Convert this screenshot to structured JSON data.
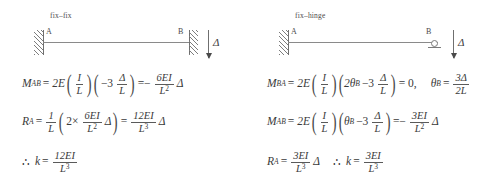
{
  "figure": {
    "line_color": "#8a8a8a",
    "text_color": "#3a3a3a",
    "background": "#ffffff"
  },
  "panels": [
    {
      "id": "fix-fix",
      "title": "fix–fix",
      "node_left": "A",
      "node_right": "B",
      "support_left": "fixed",
      "support_right": "fixed",
      "delta_label": "Δ",
      "equations": [
        {
          "id": "moment-ab",
          "parts": {
            "lhs_base": "M",
            "lhs_sub": "AB",
            "eq1": "=",
            "coef": "2E",
            "f1_num": "I",
            "f1_den": "L",
            "inner_coef": "−3",
            "f2_num": "Δ",
            "f2_den": "L",
            "eq2": "=−",
            "f3_num": "6EI",
            "f3_den": "L",
            "f3_den_sup": "2",
            "tail": "Δ"
          }
        },
        {
          "id": "reaction-a",
          "parts": {
            "lhs_base": "R",
            "lhs_sub": "A",
            "eq1": "=",
            "f1_num": "1",
            "f1_den": "L",
            "inner_coef": "2×",
            "f2_num": "6EI",
            "f2_den": "L",
            "f2_den_sup": "2",
            "inner_tail": "Δ",
            "eq2": "=",
            "f3_num": "12EI",
            "f3_den": "L",
            "f3_den_sup": "3",
            "tail": "Δ"
          }
        },
        {
          "id": "stiffness",
          "parts": {
            "therefore": "∴",
            "lhs_base": "k",
            "eq1": "=",
            "f1_num": "12EI",
            "f1_den": "L",
            "f1_den_sup": "3"
          }
        }
      ]
    },
    {
      "id": "fix-hinge",
      "title": "fix–hinge",
      "node_left": "A",
      "node_right": "B",
      "support_left": "fixed",
      "support_right": "hinge",
      "delta_label": "Δ",
      "equations": [
        {
          "id": "moment-ba",
          "parts": {
            "lhs_base": "M",
            "lhs_sub": "BA",
            "eq1": "=",
            "coef": "2E",
            "f1_num": "I",
            "f1_den": "L",
            "inner_lead": "2θ",
            "inner_lead_sub": "B",
            "inner_coef": "−3",
            "f2_num": "Δ",
            "f2_den": "L",
            "eq2": "= 0,",
            "theta_base": "θ",
            "theta_sub": "B",
            "eq3": "=",
            "f3_num": "3Δ",
            "f3_den": "2L"
          }
        },
        {
          "id": "moment-ab",
          "parts": {
            "lhs_base": "M",
            "lhs_sub": "AB",
            "eq1": "=",
            "coef": "2E",
            "f1_num": "I",
            "f1_den": "L",
            "inner_lead": "θ",
            "inner_lead_sub": "B",
            "inner_coef": "−3",
            "f2_num": "Δ",
            "f2_den": "L",
            "eq2": "=−",
            "f3_num": "3EI",
            "f3_den": "L",
            "f3_den_sup": "2",
            "tail": "Δ"
          }
        },
        {
          "id": "reaction-and-stiffness",
          "parts": {
            "lhs_base": "R",
            "lhs_sub": "A",
            "eq1": "=",
            "f1_num": "3EI",
            "f1_den": "L",
            "f1_den_sup": "3",
            "tail": "Δ",
            "therefore": "∴",
            "k_base": "k",
            "eq2": "=",
            "f3_num": "3EI",
            "f3_den": "L",
            "f3_den_sup": "3"
          }
        }
      ]
    }
  ]
}
